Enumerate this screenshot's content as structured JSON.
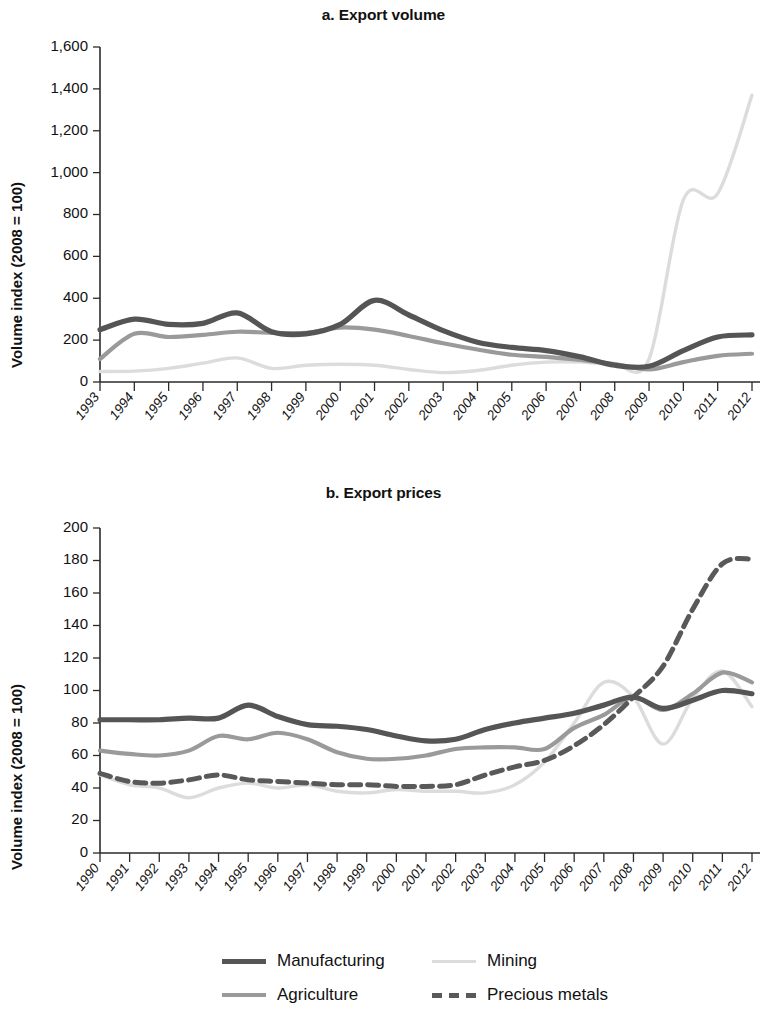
{
  "figure": {
    "background": "#ffffff",
    "panels": [
      {
        "id": "a",
        "title": "a. Export volume"
      },
      {
        "id": "b",
        "title": "b. Export prices"
      }
    ]
  },
  "legend": {
    "position": "bottom-center",
    "items": [
      {
        "label": "Manufacturing",
        "color": "#555555",
        "style": "solid",
        "width": 5
      },
      {
        "label": "Mining",
        "color": "#dcdcdc",
        "style": "solid",
        "width": 3
      },
      {
        "label": "Agriculture",
        "color": "#9a9a9a",
        "style": "solid",
        "width": 4
      },
      {
        "label": "Precious metals",
        "color": "#595959",
        "style": "dashed",
        "width": 5
      }
    ]
  },
  "chart_data": [
    {
      "type": "line",
      "panel": "a",
      "title": "a. Export volume",
      "xlabel": "",
      "ylabel": "Volume index (2008 = 100)",
      "grid": false,
      "legend": "bottom",
      "xlim": [
        1993,
        2012
      ],
      "ylim": [
        0,
        1600
      ],
      "ytick_step": 200,
      "yticks": [
        0,
        200,
        400,
        600,
        800,
        1000,
        1200,
        1400,
        1600
      ],
      "ytick_labels": [
        "0",
        "200",
        "400",
        "600",
        "800",
        "1,000",
        "1,200",
        "1,400",
        "1,600"
      ],
      "x": [
        1993,
        1994,
        1995,
        1996,
        1997,
        1998,
        1999,
        2000,
        2001,
        2002,
        2003,
        2004,
        2005,
        2006,
        2007,
        2008,
        2009,
        2010,
        2011,
        2012
      ],
      "xtick_labels": [
        "1993",
        "1994",
        "1995",
        "1996",
        "1997",
        "1998",
        "1999",
        "2000",
        "2001",
        "2002",
        "2003",
        "2004",
        "2005",
        "2006",
        "2007",
        "2008",
        "2009",
        "2010",
        "2011",
        "2012"
      ],
      "series": [
        {
          "name": "Manufacturing",
          "color": "#555555",
          "style": "solid",
          "width": 5.2,
          "values": [
            250,
            300,
            275,
            280,
            330,
            240,
            230,
            275,
            390,
            320,
            245,
            190,
            165,
            150,
            120,
            80,
            75,
            150,
            215,
            225
          ]
        },
        {
          "name": "Agriculture",
          "color": "#9a9a9a",
          "style": "solid",
          "width": 4.2,
          "values": [
            110,
            230,
            215,
            225,
            240,
            235,
            235,
            260,
            250,
            220,
            185,
            155,
            130,
            120,
            105,
            85,
            60,
            95,
            125,
            135
          ]
        },
        {
          "name": "Mining",
          "color": "#dcdcdc",
          "style": "solid",
          "width": 3.4,
          "values": [
            50,
            52,
            65,
            90,
            115,
            65,
            80,
            85,
            80,
            60,
            45,
            55,
            80,
            95,
            95,
            85,
            110,
            870,
            900,
            1370
          ]
        }
      ]
    },
    {
      "type": "line",
      "panel": "b",
      "title": "b. Export prices",
      "xlabel": "",
      "ylabel": "Volume index (2008 = 100)",
      "grid": false,
      "legend": "bottom",
      "xlim": [
        1990,
        2012
      ],
      "ylim": [
        0,
        200
      ],
      "ytick_step": 20,
      "yticks": [
        0,
        20,
        40,
        60,
        80,
        100,
        120,
        140,
        160,
        180,
        200
      ],
      "ytick_labels": [
        "0",
        "20",
        "40",
        "60",
        "80",
        "100",
        "120",
        "140",
        "160",
        "180",
        "200"
      ],
      "x": [
        1990,
        1991,
        1992,
        1993,
        1994,
        1995,
        1996,
        1997,
        1998,
        1999,
        2000,
        2001,
        2002,
        2003,
        2004,
        2005,
        2006,
        2007,
        2008,
        2009,
        2010,
        2011,
        2012
      ],
      "xtick_labels": [
        "1990",
        "1991",
        "1992",
        "1993",
        "1994",
        "1995",
        "1996",
        "1997",
        "1998",
        "1999",
        "2000",
        "2001",
        "2002",
        "2003",
        "2004",
        "2005",
        "2006",
        "2007",
        "2008",
        "2009",
        "2010",
        "2011",
        "2012"
      ],
      "series": [
        {
          "name": "Manufacturing",
          "color": "#555555",
          "style": "solid",
          "width": 5.2,
          "values": [
            82,
            82,
            82,
            83,
            83,
            91,
            84,
            79,
            78,
            76,
            72,
            69,
            70,
            76,
            80,
            83,
            86,
            91,
            96,
            89,
            94,
            100,
            98
          ]
        },
        {
          "name": "Agriculture",
          "color": "#9a9a9a",
          "style": "solid",
          "width": 4.2,
          "values": [
            63,
            61,
            60,
            63,
            72,
            70,
            74,
            70,
            62,
            58,
            58,
            60,
            64,
            65,
            65,
            64,
            77,
            85,
            96,
            88,
            98,
            111,
            105
          ]
        },
        {
          "name": "Precious metals",
          "color": "#595959",
          "style": "dashed",
          "width": 5.0,
          "values": [
            49,
            44,
            43,
            45,
            48,
            45,
            44,
            43,
            42,
            42,
            41,
            41,
            42,
            48,
            53,
            57,
            66,
            79,
            96,
            115,
            150,
            178,
            181
          ]
        },
        {
          "name": "Mining",
          "color": "#dcdcdc",
          "style": "solid",
          "width": 3.4,
          "values": [
            48,
            42,
            40,
            34,
            40,
            43,
            40,
            42,
            38,
            37,
            39,
            38,
            38,
            37,
            42,
            56,
            80,
            105,
            96,
            67,
            95,
            112,
            90
          ]
        }
      ]
    }
  ]
}
